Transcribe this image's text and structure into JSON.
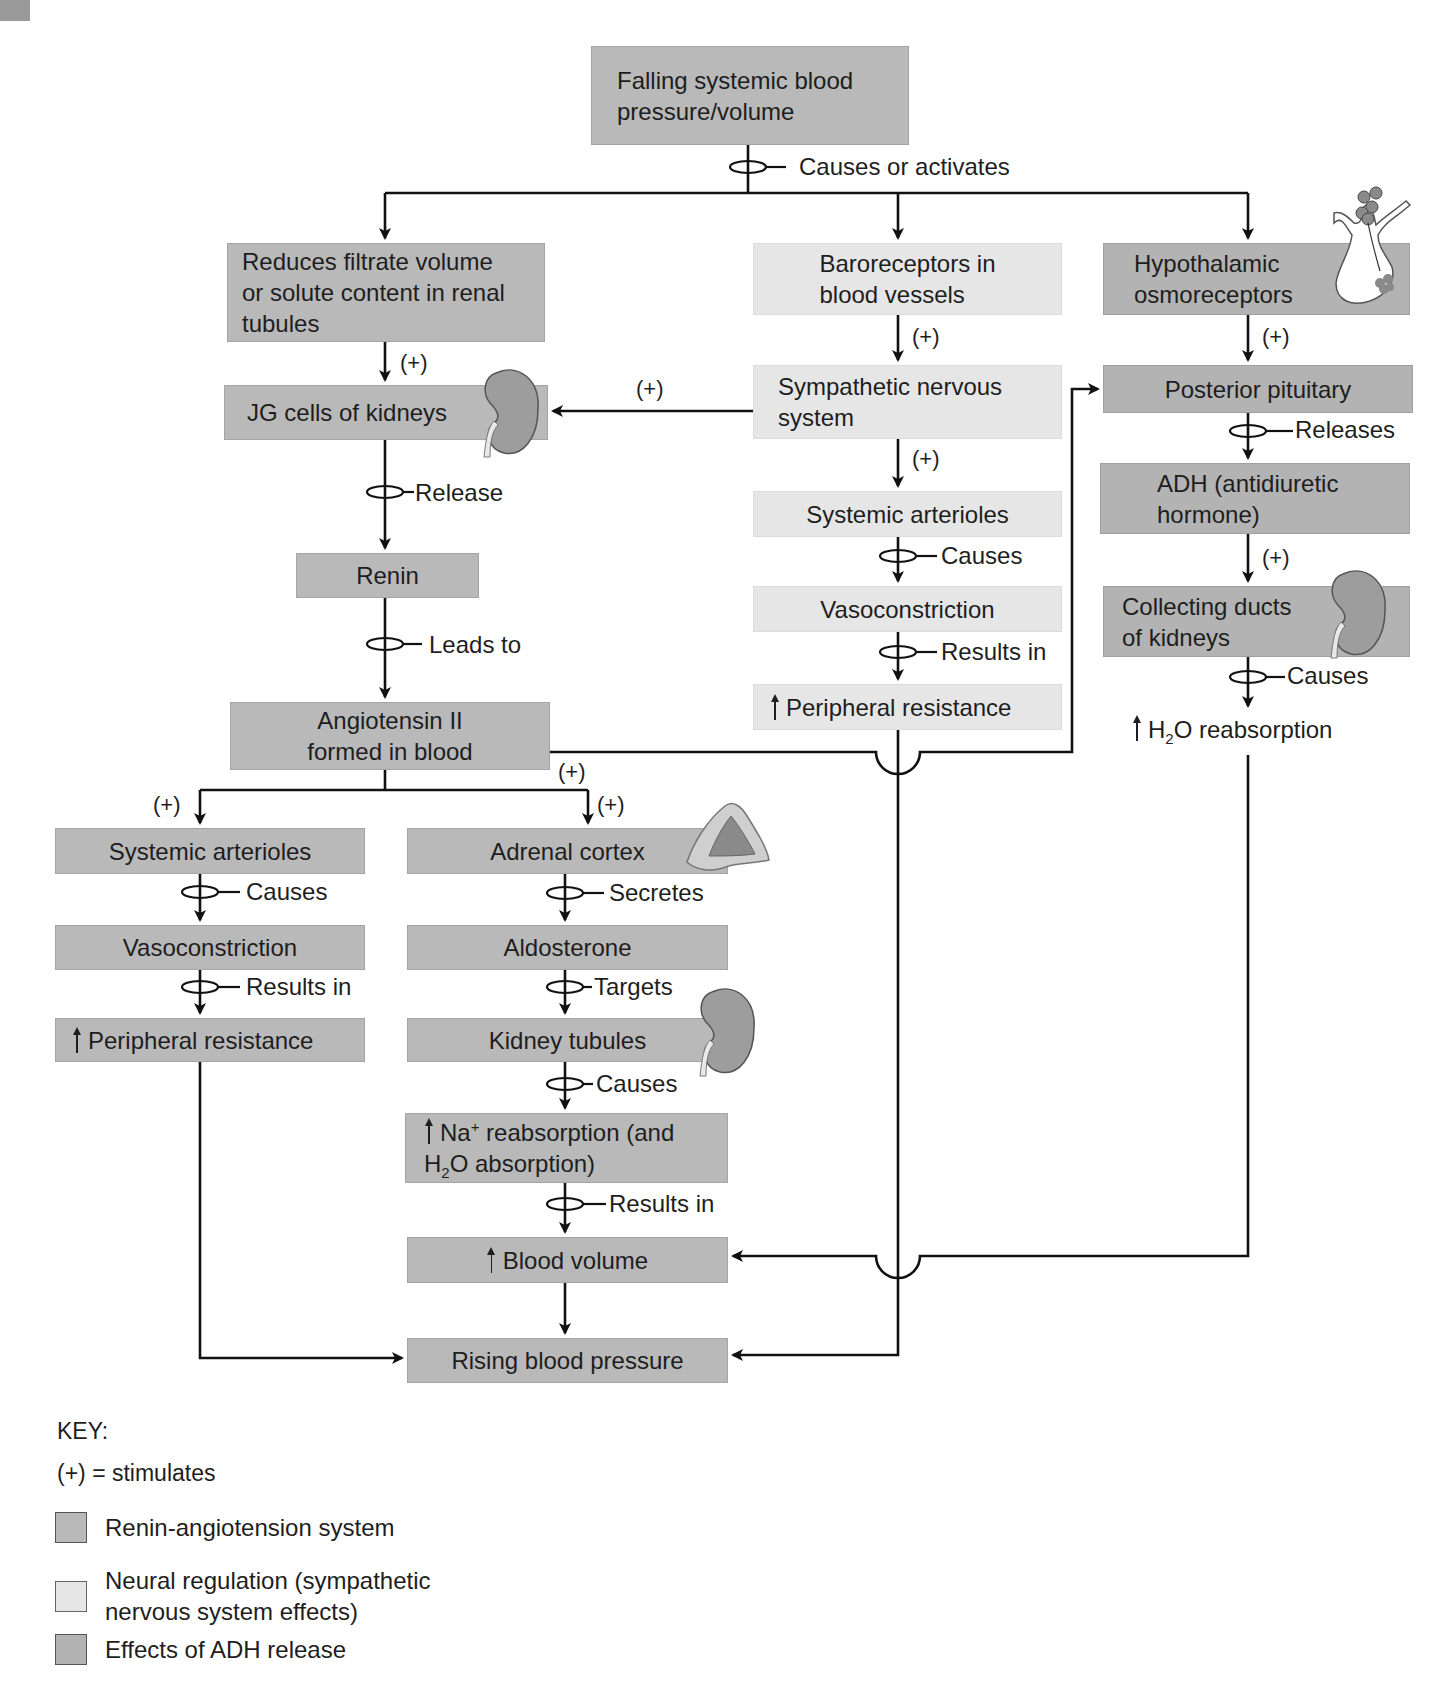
{
  "colors": {
    "renin_angiotensin_fill": "#b9b9b9",
    "neural_fill": "#e6e6e6",
    "adh_fill": "#b3b3b3",
    "line": "#111111"
  },
  "top": {
    "start": "Falling systemic blood pressure/volume",
    "start_line1": "Falling systemic blood",
    "start_line2": "pressure/volume",
    "connector_label": "Causes or activates"
  },
  "renin_angiotensin": {
    "filtrate": {
      "line1": "Reduces filtrate volume",
      "line2": "or solute content in renal",
      "line3": "tubules"
    },
    "jg_cells": "JG cells of kidneys",
    "release_label": "Release",
    "renin": "Renin",
    "leads_to_label": "Leads to",
    "angiotensin": {
      "line1": "Angiotensin II",
      "line2": "formed in blood"
    },
    "left_branch": {
      "arterioles": "Systemic arterioles",
      "causes_label": "Causes",
      "vasoconstriction": "Vasoconstriction",
      "results_label": "Results in",
      "resistance": "Peripheral resistance"
    },
    "right_branch": {
      "adrenal": "Adrenal cortex",
      "secretes_label": "Secretes",
      "aldosterone": "Aldosterone",
      "targets_label": "Targets",
      "tubules": "Kidney tubules",
      "causes_label": "Causes",
      "na_line1_pre": "Na",
      "na_line1_sup": "+",
      "na_line1_post": " reabsorption (and",
      "na_line2_pre": "H",
      "na_line2_sub": "2",
      "na_line2_post": "O absorption)",
      "results_label": "Results in",
      "blood_volume": "Blood volume"
    }
  },
  "neural": {
    "baroreceptors": {
      "line1": "Baroreceptors in",
      "line2": "blood vessels"
    },
    "sympathetic": {
      "line1": "Sympathetic nervous",
      "line2": "system"
    },
    "arterioles": "Systemic arterioles",
    "causes_label": "Causes",
    "vasoconstriction": "Vasoconstriction",
    "results_label": "Results in",
    "resistance": "Peripheral resistance"
  },
  "adh": {
    "hypothalamic": {
      "line1": "Hypothalamic",
      "line2": "osmoreceptors"
    },
    "posterior": "Posterior pituitary",
    "releases_label": "Releases",
    "adh_box": {
      "line1": "ADH (antidiuretic",
      "line2": "hormone)"
    },
    "collecting": {
      "line1": "Collecting ducts",
      "line2": "of kidneys"
    },
    "causes_label": "Causes",
    "h2o_pre": "H",
    "h2o_sub": "2",
    "h2o_post": "O reabsorption"
  },
  "outcome": "Rising blood pressure",
  "stimulates_mark": "(+)",
  "key": {
    "title": "KEY:",
    "plus_def": "(+) = stimulates",
    "items": [
      {
        "label_line1": "Renin-angiotension system",
        "label_line2": "",
        "color": "#b9b9b9"
      },
      {
        "label_line1": "Neural regulation (sympathetic",
        "label_line2": "nervous system effects)",
        "color": "#e6e6e6"
      },
      {
        "label_line1": "Effects of ADH release",
        "label_line2": "",
        "color": "#b3b3b3"
      }
    ]
  }
}
